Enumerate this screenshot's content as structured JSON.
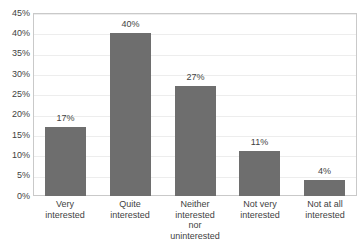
{
  "chart_data": {
    "type": "bar",
    "title": "",
    "subtitle": "",
    "xlabel": "",
    "ylabel": "",
    "categories": [
      "Very interested",
      "Quite interested",
      "Neither interested nor uninterested",
      "Not very interested",
      "Not at all interested"
    ],
    "category_lines": [
      [
        "Very",
        "interested"
      ],
      [
        "Quite",
        "interested"
      ],
      [
        "Neither",
        "interested",
        "nor",
        "uninterested"
      ],
      [
        "Not very",
        "interested"
      ],
      [
        "Not at all",
        "interested"
      ]
    ],
    "values": [
      17,
      40,
      27,
      11,
      4
    ],
    "data_labels": [
      "17%",
      "40%",
      "27%",
      "11%",
      "4%"
    ],
    "ylim": [
      0,
      45
    ],
    "ytick_values": [
      0,
      5,
      10,
      15,
      20,
      25,
      30,
      35,
      40,
      45
    ],
    "ytick_labels": [
      "0%",
      "5%",
      "10%",
      "15%",
      "20%",
      "25%",
      "30%",
      "35%",
      "40%",
      "45%"
    ],
    "grid": true,
    "legend": false,
    "legend_position": "none",
    "bar_color": "#6e6e6e",
    "plot_border_color": "#c9c9c9",
    "gridline_color": "#ededed",
    "background_color": "#ffffff",
    "text_color": "#3f3f3f"
  }
}
